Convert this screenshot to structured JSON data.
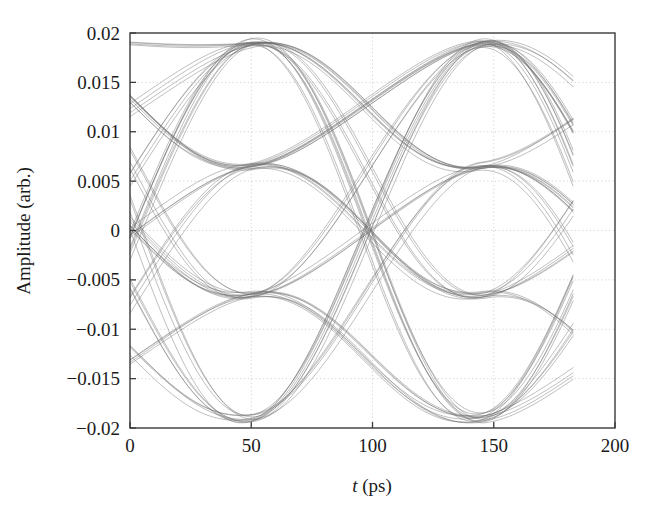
{
  "chart_data": {
    "type": "line",
    "title": "",
    "subtitle": "",
    "xlabel": "t (ps)",
    "xlabel_italic_part": "t",
    "xlabel_rest": " (ps)",
    "ylabel": "Amplitude (arb.)",
    "xlim": [
      0,
      200
    ],
    "ylim": [
      -0.02,
      0.02
    ],
    "xticks": [
      0,
      50,
      100,
      150,
      200
    ],
    "xtick_labels": [
      "0",
      "50",
      "100",
      "150",
      "200"
    ],
    "yticks": [
      0.02,
      0.015,
      0.01,
      0.005,
      0,
      -0.005,
      -0.01,
      -0.015,
      -0.02
    ],
    "ytick_labels": [
      "0.02",
      "0.015",
      "0.01",
      "0.005",
      "0",
      "−0.005",
      "−0.01",
      "−0.015",
      "−0.02"
    ],
    "grid": true,
    "grid_style": "dotted",
    "grid_color": "#c9c9c9",
    "legend": null,
    "trace_color": "#6e6e6e",
    "trace_opacity": 0.5,
    "trace_width": 0.9,
    "axis_color": "#3a3a3a",
    "data_x_start": 0,
    "data_x_end": 183,
    "symbol_period_ps": 95,
    "crossing_times_ps": [
      53,
      148
    ],
    "levels": [
      0.019,
      0.0065,
      -0.0065,
      -0.019
    ],
    "level_labels": [
      "+3 (0.019)",
      "+1 (0.0065)",
      "-1 (-0.0065)",
      "-3 (-0.019)"
    ],
    "n_traces": 64,
    "level_jitter": 0.0006,
    "time_jitter_ps": 1.6,
    "series": [
      {
        "name": "eye-traces",
        "level_sequences": [
          [
            3,
            1,
            -1,
            -3
          ],
          [
            3,
            -3,
            3,
            -3
          ],
          [
            1,
            -1,
            1,
            -1
          ],
          [
            -3,
            3,
            -3,
            3
          ],
          [
            3,
            3,
            -1,
            1
          ],
          [
            -1,
            -3,
            1,
            3
          ],
          [
            1,
            3,
            -3,
            -1
          ],
          [
            -3,
            -1,
            3,
            1
          ],
          [
            3,
            -1,
            -3,
            1
          ],
          [
            1,
            -3,
            3,
            -1
          ],
          [
            -1,
            3,
            1,
            -3
          ],
          [
            -3,
            1,
            -1,
            3
          ],
          [
            3,
            1,
            3,
            -1
          ],
          [
            1,
            -1,
            -3,
            3
          ],
          [
            -1,
            1,
            3,
            -3
          ],
          [
            -3,
            3,
            1,
            -1
          ]
        ]
      }
    ]
  },
  "figure": {
    "background": "#ffffff",
    "plot_left_px": 130,
    "plot_right_px": 615,
    "plot_top_px": 33,
    "plot_bottom_px": 428
  }
}
